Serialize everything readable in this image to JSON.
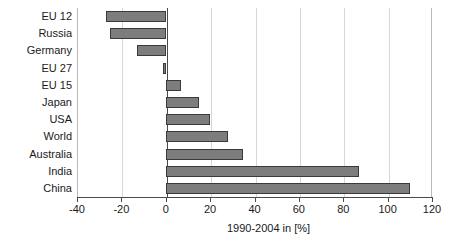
{
  "chart_data": {
    "type": "bar",
    "orientation": "horizontal",
    "title": "",
    "subtitle": "",
    "xlabel": "1990-2004 in [%]",
    "ylabel": "",
    "xlim": [
      -40,
      120
    ],
    "xticks": [
      -40,
      -20,
      0,
      20,
      40,
      60,
      80,
      100,
      120
    ],
    "xtick_labels": [
      "-40",
      "-20",
      "0",
      "20",
      "40",
      "60",
      "80",
      "100",
      "120"
    ],
    "grid": true,
    "grid_axis": "x",
    "legend": false,
    "legend_position": "none",
    "categories": [
      "EU 12",
      "Russia",
      "Germany",
      "EU 27",
      "EU 15",
      "Japan",
      "USA",
      "World",
      "Australia",
      "India",
      "China"
    ],
    "values": [
      -27,
      -25,
      -13,
      -1,
      7,
      15,
      20,
      28,
      35,
      87,
      110
    ],
    "series": [
      {
        "name": "1990-2004 change",
        "values": [
          -27,
          -25,
          -13,
          -1,
          7,
          15,
          20,
          28,
          35,
          87,
          110
        ]
      }
    ],
    "annotations": []
  },
  "style": {
    "bar_fill": "#7d7d7d",
    "bar_edge": "#3a3a3a",
    "grid_color": "#d6d6d6",
    "axis_color": "#4a4a4a",
    "text_color": "#1a1a1a",
    "background": "#ffffff"
  }
}
